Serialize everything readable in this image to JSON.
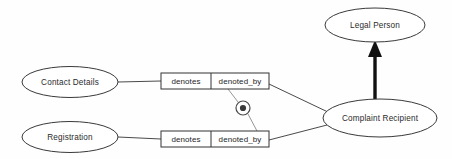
{
  "diagram": {
    "background_color": "#fefefe",
    "line_color": "#4a4a4a",
    "text_color": "#2b2b2b",
    "entities": [
      {
        "id": "contact_details",
        "label": "Contact Details",
        "cx": 70,
        "cy": 82,
        "rx": 48,
        "ry": 15.5
      },
      {
        "id": "registration",
        "label": "Registration",
        "cx": 70,
        "cy": 137,
        "rx": 48,
        "ry": 15.5
      },
      {
        "id": "legal_person",
        "label": "Legal Person",
        "cx": 375,
        "cy": 25,
        "rx": 50,
        "ry": 17
      },
      {
        "id": "complaint_recipient",
        "label": "Complaint Recipient",
        "cx": 380,
        "cy": 118,
        "rx": 57,
        "ry": 19
      }
    ],
    "fact_types": [
      {
        "id": "contact_fact",
        "x": 161,
        "y": 73,
        "width": 108,
        "height": 16,
        "divider_x": 211,
        "roles": [
          {
            "id": "contact_denotes",
            "label": "denotes"
          },
          {
            "id": "contact_denoted_by",
            "label": "denoted_by"
          }
        ]
      },
      {
        "id": "registration_fact",
        "x": 161,
        "y": 131,
        "width": 108,
        "height": 16,
        "divider_x": 211,
        "roles": [
          {
            "id": "registration_denotes",
            "label": "denotes"
          },
          {
            "id": "registration_denoted_by",
            "label": "denoted_by"
          }
        ]
      }
    ],
    "constraint": {
      "id": "exclusion_constraint",
      "kind": "exclusive-or-constraint",
      "cx": 243,
      "cy": 108,
      "outer_radius": 7,
      "inner_radius": 3.1,
      "ring_color": "#4a4a4a",
      "dot_color": "#3a3a3a"
    },
    "subtype_arrow": {
      "id": "subtype_link",
      "from": "complaint_recipient",
      "to": "legal_person",
      "color": "#111111",
      "x": 375,
      "y_start": 99,
      "y_end": 42
    },
    "connectors": [
      {
        "id": "contact-to-fact",
        "d": "M 118 82 L 161 81"
      },
      {
        "id": "registration-to-fact",
        "d": "M 118 137 L 161 139"
      },
      {
        "id": "contact-fact-to-recipient",
        "d": "M 269 84 L 330 113"
      },
      {
        "id": "registration-fact-to-recipient",
        "d": "M 269 140 L 327 125"
      },
      {
        "id": "constraint-to-contact-fact",
        "d": "M 238 102 L 228 89"
      },
      {
        "id": "constraint-to-registration-fact",
        "d": "M 248 114 L 257 131"
      }
    ]
  }
}
